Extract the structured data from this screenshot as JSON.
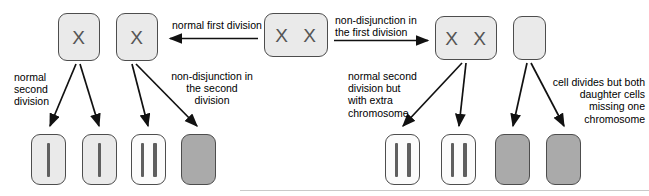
{
  "diagram": {
    "colors": {
      "cell_fill_light": "#eaeaea",
      "cell_fill_white": "#fbfbfb",
      "cell_fill_dark": "#aaaaaa",
      "cell_border": "#4d4d4d",
      "chromosome": "#5f5f5f",
      "text": "#000000",
      "rule": "#c9c9c9"
    },
    "labels": {
      "normal_first_division": "normal first division",
      "nondisjunction_first_division": "non-disjunction in\nthe first division",
      "normal_second_division": "normal\nsecond\ndivision",
      "nondisjunction_second_division": "non-disjunction in\nthe second\ndivision",
      "normal_second_extra_chromosome": "normal second\ndivision but\nwith extra\nchromosome",
      "daughter_cells_missing_chromosome": "cell divides but both\ndaughter cells\nmissing one\nchromosome"
    },
    "top_cells": [
      {
        "id": "left-haploid-a",
        "content": "X",
        "fill": "light",
        "x": 58,
        "y": 13,
        "w": 42,
        "h": 48
      },
      {
        "id": "left-haploid-b",
        "content": "X",
        "fill": "light",
        "x": 116,
        "y": 13,
        "w": 42,
        "h": 48
      },
      {
        "id": "parent-cell",
        "content": "X X",
        "fill": "light",
        "x": 264,
        "y": 13,
        "w": 64,
        "h": 44
      },
      {
        "id": "disomic-cell",
        "content": "X X",
        "fill": "light",
        "x": 435,
        "y": 16,
        "w": 62,
        "h": 44
      },
      {
        "id": "nullisomic-cell",
        "content": "",
        "fill": "light",
        "x": 513,
        "y": 16,
        "w": 33,
        "h": 44
      }
    ],
    "bottom_cells": [
      {
        "id": "gamete-1",
        "chromosomes": 1,
        "fill": "light",
        "x": 31,
        "y": 134,
        "w": 35,
        "h": 51
      },
      {
        "id": "gamete-2",
        "chromosomes": 1,
        "fill": "light",
        "x": 82,
        "y": 134,
        "w": 35,
        "h": 51
      },
      {
        "id": "gamete-3",
        "chromosomes": 2,
        "fill": "white",
        "x": 131,
        "y": 134,
        "w": 35,
        "h": 51
      },
      {
        "id": "gamete-4",
        "chromosomes": 0,
        "fill": "dark",
        "x": 181,
        "y": 134,
        "w": 35,
        "h": 51
      },
      {
        "id": "gamete-5",
        "chromosomes": 2,
        "fill": "white",
        "x": 385,
        "y": 134,
        "w": 35,
        "h": 51
      },
      {
        "id": "gamete-6",
        "chromosomes": 2,
        "fill": "white",
        "x": 441,
        "y": 134,
        "w": 35,
        "h": 51
      },
      {
        "id": "gamete-7",
        "chromosomes": 0,
        "fill": "dark",
        "x": 495,
        "y": 134,
        "w": 35,
        "h": 51
      },
      {
        "id": "gamete-8",
        "chromosomes": 0,
        "fill": "dark",
        "x": 546,
        "y": 134,
        "w": 35,
        "h": 51
      }
    ]
  }
}
